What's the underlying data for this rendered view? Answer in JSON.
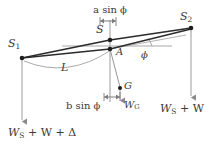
{
  "figure": {
    "width": 219,
    "height": 147,
    "background": "#ffffff",
    "line_color_dark": "#2b2b2b",
    "line_color_light": "#9a9a9a",
    "text_color": "#3a3a3a"
  },
  "points": [
    {
      "id": "S1",
      "label": "S",
      "subscript": "1",
      "x": 22,
      "y": 58
    },
    {
      "id": "S",
      "label": "S",
      "subscript": "",
      "x": 110,
      "y": 40
    },
    {
      "id": "A",
      "label": "A",
      "subscript": "",
      "x": 110,
      "y": 49
    },
    {
      "id": "G",
      "label": "G",
      "subscript": "",
      "x": 120,
      "y": 88
    },
    {
      "id": "S2",
      "label": "S",
      "subscript": "2",
      "x": 191,
      "y": 28
    }
  ],
  "labels": {
    "top_dimension": {
      "text": "a sin ϕ",
      "x": 96,
      "y": 8
    },
    "bottom_dimension": {
      "text": "b sin ϕ",
      "x": 72,
      "y": 104
    },
    "arc_length": {
      "text": "L",
      "x": 65,
      "y": 66
    },
    "angle": {
      "text": "ϕ",
      "x": 143,
      "y": 55
    },
    "weight_G": {
      "text": "W",
      "subscript": "G",
      "x": 124,
      "y": 103
    },
    "weight_left": {
      "text": "W",
      "subscript": "S",
      "rest": " + W + Δ",
      "x": 10,
      "y": 130
    },
    "weight_right": {
      "text": "W",
      "subscript": "S",
      "rest": " + W",
      "x": 163,
      "y": 106
    },
    "point_S1": {
      "text": "S",
      "subscript": "1",
      "x": 10,
      "y": 44
    },
    "point_S": {
      "text": "S",
      "subscript": "",
      "x": 97,
      "y": 28
    },
    "point_A": {
      "text": "A",
      "subscript": "",
      "x": 117,
      "y": 50
    },
    "point_G": {
      "text": "G",
      "subscript": "",
      "x": 125,
      "y": 82
    },
    "point_S2": {
      "text": "S",
      "subscript": "2",
      "x": 181,
      "y": 14
    }
  },
  "geometry": {
    "hull_upper_polyline": "22,58 110,40 191,28",
    "hull_lower_polyline": "22,58 110,49 191,29",
    "horizontal_reference_y": 46,
    "horizontal_reference_x1": 62,
    "horizontal_reference_x2": 172,
    "arc_path": "M 24,60 Q 70,76 112,49",
    "vertical_S1_x": 22,
    "vertical_S1_y1": 58,
    "vertical_S1_y2": 124,
    "vertical_S_x": 110,
    "vertical_S_y1": 36,
    "vertical_S_y2": 100,
    "vertical_S2_x": 191,
    "vertical_S2_y1": 28,
    "vertical_S2_y2": 100,
    "line_A_to_G": "110,49 120,88"
  },
  "icons": {
    "arrowhead": "downward-arrowhead",
    "dimension_tick": "dimension-tick-marker",
    "point_marker": "filled-dot"
  }
}
